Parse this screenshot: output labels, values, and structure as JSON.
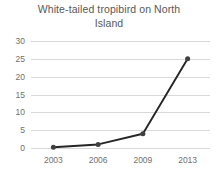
{
  "chart_data": {
    "type": "line",
    "title": "White-tailed tropibird on North Island",
    "title_lines": [
      "White-tailed tropibird on North",
      "Island"
    ],
    "xlabel": "",
    "ylabel": "",
    "categories": [
      "2003",
      "2006",
      "2009",
      "2013"
    ],
    "values": [
      0.2,
      1,
      4,
      25
    ],
    "series": [
      {
        "name": "White-tailed tropibird",
        "values": [
          0.2,
          1,
          4,
          25
        ]
      }
    ],
    "ylim": [
      0,
      30
    ],
    "ytick_labels": [
      "30",
      "25",
      "20",
      "15",
      "10",
      "5",
      "0"
    ],
    "ytick_values": [
      30,
      25,
      20,
      15,
      10,
      5,
      0
    ],
    "ytick_step": 5,
    "grid": "horizontal",
    "legend": "none",
    "line_color": "#262626",
    "marker_color": "#404040",
    "marker_shape": "circle",
    "gridline_color": "#d9d9d9",
    "text_color": "#707070",
    "title_color": "#585858",
    "background_color": "#ffffff"
  }
}
